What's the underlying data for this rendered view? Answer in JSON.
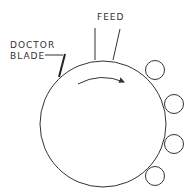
{
  "diagram": {
    "labels": {
      "feed": "FEED",
      "doctor_line1": "DOCTOR",
      "doctor_line2": "BLADE"
    },
    "drum": {
      "cx": 103,
      "cy": 124,
      "r": 63
    },
    "rollers": [
      {
        "cx": 155,
        "cy": 70,
        "r": 9.5
      },
      {
        "cx": 174,
        "cy": 104,
        "r": 9.5
      },
      {
        "cx": 174,
        "cy": 144,
        "r": 9.5
      },
      {
        "cx": 155,
        "cy": 176,
        "r": 9.5
      }
    ],
    "rotation_direction": "clockwise",
    "colors": {
      "line": "#333333",
      "background": "#ffffff"
    }
  }
}
